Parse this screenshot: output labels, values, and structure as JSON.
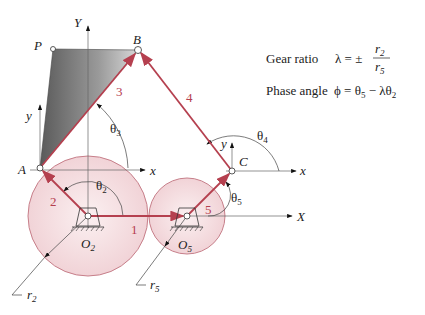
{
  "labels": {
    "Y_axis": "Y",
    "X_axis": "X",
    "P": "P",
    "B": "B",
    "A": "A",
    "C": "C",
    "O2": "O",
    "O2_sub": "2",
    "O5": "O",
    "O5_sub": "5",
    "local_y_A": "y",
    "local_x_A": "x",
    "local_y_C": "y",
    "local_x_C": "x",
    "link1": "1",
    "link2": "2",
    "link3": "3",
    "link4": "4",
    "link5": "5",
    "theta2": "θ",
    "theta2_sub": "2",
    "theta3": "θ",
    "theta3_sub": "3",
    "theta4": "θ",
    "theta4_sub": "4",
    "theta5": "θ",
    "theta5_sub": "5",
    "r2": "r",
    "r2_sub": "2",
    "r5": "r",
    "r5_sub": "5"
  },
  "equations": {
    "gear_ratio_label": "Gear ratio",
    "gear_ratio_lhs": "λ = ±",
    "gear_ratio_num": "r",
    "gear_ratio_num_sub": "2",
    "gear_ratio_den": "r",
    "gear_ratio_den_sub": "5",
    "phase_angle_label": "Phase angle",
    "phase_angle_expr_a": "ϕ = θ",
    "phase_angle_sub_a": "5",
    "phase_angle_expr_b": " − λθ",
    "phase_angle_sub_b": "2"
  },
  "colors": {
    "link": "#b5404f",
    "gear_fill": "#f4dde0",
    "gear_stroke": "#c77f8a",
    "axis": "#555555"
  }
}
